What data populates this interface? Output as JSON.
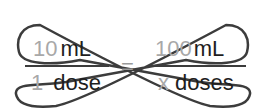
{
  "diagram": {
    "type": "cross-multiplication",
    "left_fraction": {
      "numerator": {
        "value": "10",
        "unit": "mL"
      },
      "denominator": {
        "value": "1",
        "unit": "dose"
      }
    },
    "equals": "=",
    "right_fraction": {
      "numerator": {
        "value": "100",
        "unit": "mL"
      },
      "denominator": {
        "value": "x",
        "unit": "doses"
      }
    },
    "colors": {
      "numbers": "#a8a8a8",
      "units": "#1e1e1e",
      "loops": "#3c3c3c"
    }
  }
}
